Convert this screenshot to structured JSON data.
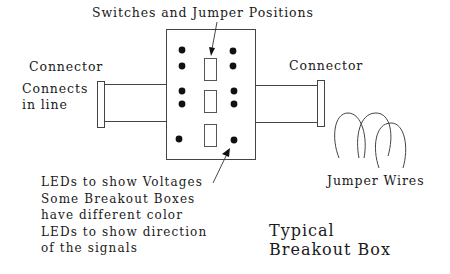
{
  "diagram": {
    "title": "Typical Breakout Box",
    "title_lines": [
      "Typical",
      "Breakout Box"
    ],
    "labels": {
      "switches": "Switches and Jumper Positions",
      "connector_left": "Connector",
      "connector_right": "Connector",
      "connects_line1": "Connects",
      "connects_line2": "in line",
      "jumper_wires": "Jumper Wires",
      "leds_lines": [
        "LEDs to show Voltages",
        "Some Breakout Boxes",
        "have different color",
        "LEDs to show direction",
        "of the signals"
      ]
    },
    "components": {
      "led_count": 10,
      "switch_count": 3,
      "connector_count": 2,
      "jumper_wire_loops": 3
    },
    "colors": {
      "line": "#3a3a3a",
      "led": "#111111",
      "background": "#ffffff"
    }
  }
}
